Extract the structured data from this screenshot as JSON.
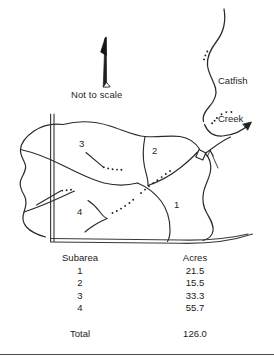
{
  "figure": {
    "kind": "watershed-subarea-map",
    "not_to_scale_note": "Not to scale",
    "north_arrow": "north-arrow-icon",
    "creek": {
      "label_line1": "Catfish",
      "label_line2": "Creek",
      "flow_arrow": "flow-direction-arrow-icon"
    },
    "outlet": {
      "marker": "outlet-diamond-icon",
      "pointer": "outlet-pointer-arrow-icon"
    },
    "subarea_labels": [
      {
        "id": "1",
        "text": "1"
      },
      {
        "id": "2",
        "text": "2"
      },
      {
        "id": "3",
        "text": "3"
      },
      {
        "id": "4",
        "text": "4"
      }
    ],
    "colors": {
      "ink": "#1f1f1f",
      "line": "#2b2b2b",
      "rule": "#4a4a4a",
      "background": "#ffffff"
    }
  },
  "table": {
    "headers": {
      "subarea": "Subarea",
      "acres": "Acres"
    },
    "rows": [
      {
        "subarea": "1",
        "acres": "21.5"
      },
      {
        "subarea": "2",
        "acres": "15.5"
      },
      {
        "subarea": "3",
        "acres": "33.3"
      },
      {
        "subarea": "4",
        "acres": "55.7"
      }
    ],
    "total": {
      "label": "Total",
      "acres": "126.0"
    }
  }
}
